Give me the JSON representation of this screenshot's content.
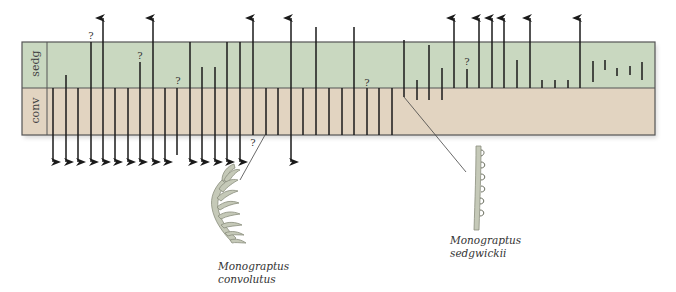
{
  "diagram": {
    "zones": [
      {
        "id": "sedg",
        "label": "sedg",
        "color": "#c9d8c0",
        "y_top": 42,
        "y_bottom": 88
      },
      {
        "id": "conv",
        "label": "conv",
        "color": "#e2d4c1",
        "y_top": 88,
        "y_bottom": 135
      }
    ],
    "box": {
      "x_left": 22,
      "x_label_divider": 47,
      "x_right": 655,
      "border_color": "#555555"
    },
    "section_dividers_x": [
      190,
      404
    ],
    "ranges": [
      {
        "x": 53,
        "top": 88,
        "bottom": 162,
        "top_arrow": false,
        "bottom_arrow": true
      },
      {
        "x": 66,
        "top": 75,
        "bottom": 162,
        "top_arrow": false,
        "bottom_arrow": true
      },
      {
        "x": 78,
        "top": 88,
        "bottom": 162,
        "top_arrow": false,
        "bottom_arrow": true
      },
      {
        "x": 91,
        "top": 42,
        "bottom": 162,
        "top_arrow": false,
        "bottom_arrow": true,
        "question_top": true
      },
      {
        "x": 103,
        "top": 18,
        "bottom": 162,
        "top_arrow": true,
        "bottom_arrow": true
      },
      {
        "x": 115,
        "top": 88,
        "bottom": 162,
        "top_arrow": false,
        "bottom_arrow": true
      },
      {
        "x": 128,
        "top": 88,
        "bottom": 162,
        "top_arrow": false,
        "bottom_arrow": true
      },
      {
        "x": 140,
        "top": 62,
        "bottom": 162,
        "top_arrow": false,
        "bottom_arrow": true,
        "question_top": true
      },
      {
        "x": 153,
        "top": 18,
        "bottom": 162,
        "top_arrow": true,
        "bottom_arrow": true
      },
      {
        "x": 165,
        "top": 88,
        "bottom": 162,
        "top_arrow": false,
        "bottom_arrow": true
      },
      {
        "x": 177,
        "top": 88,
        "bottom": 155,
        "top_arrow": false,
        "bottom_arrow": false,
        "question_top": true
      },
      {
        "x": 190,
        "top": 42,
        "bottom": 162,
        "top_arrow": false,
        "bottom_arrow": true
      },
      {
        "x": 202,
        "top": 67,
        "bottom": 162,
        "top_arrow": false,
        "bottom_arrow": true
      },
      {
        "x": 215,
        "top": 67,
        "bottom": 162,
        "top_arrow": false,
        "bottom_arrow": true
      },
      {
        "x": 227,
        "top": 42,
        "bottom": 162,
        "top_arrow": false,
        "bottom_arrow": true
      },
      {
        "x": 240,
        "top": 42,
        "bottom": 162,
        "top_arrow": false,
        "bottom_arrow": true
      },
      {
        "x": 253,
        "top": 18,
        "bottom": 135,
        "top_arrow": true,
        "bottom_arrow": false,
        "question_bottom": true
      },
      {
        "x": 266,
        "top": 88,
        "bottom": 135,
        "top_arrow": false,
        "bottom_arrow": false
      },
      {
        "x": 278,
        "top": 88,
        "bottom": 135,
        "top_arrow": false,
        "bottom_arrow": false
      },
      {
        "x": 291,
        "top": 18,
        "bottom": 162,
        "top_arrow": true,
        "bottom_arrow": true
      },
      {
        "x": 303,
        "top": 88,
        "bottom": 135,
        "top_arrow": false,
        "bottom_arrow": false
      },
      {
        "x": 316,
        "top": 27,
        "bottom": 135,
        "top_arrow": false,
        "bottom_arrow": false
      },
      {
        "x": 329,
        "top": 88,
        "bottom": 135,
        "top_arrow": false,
        "bottom_arrow": false
      },
      {
        "x": 342,
        "top": 88,
        "bottom": 135,
        "top_arrow": false,
        "bottom_arrow": false
      },
      {
        "x": 354,
        "top": 27,
        "bottom": 135,
        "top_arrow": false,
        "bottom_arrow": false
      },
      {
        "x": 367,
        "top": 88,
        "bottom": 135,
        "top_arrow": false,
        "bottom_arrow": false,
        "question_top": true
      },
      {
        "x": 379,
        "top": 88,
        "bottom": 135,
        "top_arrow": false,
        "bottom_arrow": false
      },
      {
        "x": 392,
        "top": 88,
        "bottom": 135,
        "top_arrow": false,
        "bottom_arrow": false
      },
      {
        "x": 404,
        "top": 40,
        "bottom": 97,
        "top_arrow": false,
        "bottom_arrow": false
      },
      {
        "x": 417,
        "top": 80,
        "bottom": 100,
        "top_arrow": false,
        "bottom_arrow": false
      },
      {
        "x": 429,
        "top": 45,
        "bottom": 100,
        "top_arrow": false,
        "bottom_arrow": false
      },
      {
        "x": 442,
        "top": 68,
        "bottom": 100,
        "top_arrow": false,
        "bottom_arrow": false
      },
      {
        "x": 454,
        "top": 18,
        "bottom": 88,
        "top_arrow": true,
        "bottom_arrow": false
      },
      {
        "x": 467,
        "top": 69,
        "bottom": 88,
        "top_arrow": false,
        "bottom_arrow": false,
        "question_top": true
      },
      {
        "x": 479,
        "top": 18,
        "bottom": 88,
        "top_arrow": true,
        "bottom_arrow": false
      },
      {
        "x": 492,
        "top": 18,
        "bottom": 88,
        "top_arrow": true,
        "bottom_arrow": false
      },
      {
        "x": 504,
        "top": 18,
        "bottom": 88,
        "top_arrow": true,
        "bottom_arrow": false
      },
      {
        "x": 517,
        "top": 60,
        "bottom": 88,
        "top_arrow": false,
        "bottom_arrow": false
      },
      {
        "x": 530,
        "top": 18,
        "bottom": 88,
        "top_arrow": true,
        "bottom_arrow": false
      },
      {
        "x": 542,
        "top": 80,
        "bottom": 88,
        "top_arrow": false,
        "bottom_arrow": false
      },
      {
        "x": 555,
        "top": 80,
        "bottom": 88,
        "top_arrow": false,
        "bottom_arrow": false
      },
      {
        "x": 568,
        "top": 80,
        "bottom": 88,
        "top_arrow": false,
        "bottom_arrow": false
      },
      {
        "x": 580,
        "top": 18,
        "bottom": 88,
        "top_arrow": true,
        "bottom_arrow": false
      },
      {
        "x": 593,
        "top": 61,
        "bottom": 82,
        "top_arrow": false,
        "bottom_arrow": false
      },
      {
        "x": 605,
        "top": 60,
        "bottom": 70,
        "top_arrow": false,
        "bottom_arrow": false
      },
      {
        "x": 617,
        "top": 68,
        "bottom": 76,
        "top_arrow": false,
        "bottom_arrow": false
      },
      {
        "x": 630,
        "top": 66,
        "bottom": 75,
        "top_arrow": false,
        "bottom_arrow": false
      },
      {
        "x": 642,
        "top": 62,
        "bottom": 80,
        "top_arrow": false,
        "bottom_arrow": false
      }
    ],
    "question_mark": "?",
    "question_marks": [
      {
        "x": 91,
        "y": 30
      },
      {
        "x": 140,
        "y": 50
      },
      {
        "x": 178,
        "y": 75
      },
      {
        "x": 253,
        "y": 137
      },
      {
        "x": 367,
        "y": 77
      },
      {
        "x": 467,
        "y": 56
      }
    ],
    "leader_lines": [
      {
        "from": [
          265,
          135
        ],
        "to": [
          240,
          180
        ]
      },
      {
        "from": [
          404,
          97
        ],
        "to": [
          466,
          172
        ]
      }
    ],
    "species": [
      {
        "name_line1": "Monograptus",
        "name_line2": "convolutus",
        "caption_x": 218,
        "caption_y": 260
      },
      {
        "name_line1": "Monograptus",
        "name_line2": "sedgwickii",
        "caption_x": 450,
        "caption_y": 234
      }
    ]
  }
}
